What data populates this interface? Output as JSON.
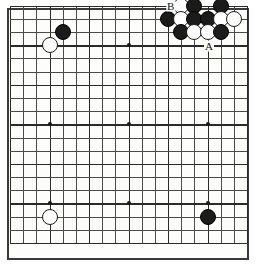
{
  "board": {
    "type": "go-board",
    "size": 19,
    "title": "Go board diagram",
    "origin_px": {
      "x": 10.0,
      "y": 5.8
    },
    "spacing_px": 13.17,
    "star_points": [
      {
        "col": 4,
        "row": 4
      },
      {
        "col": 10,
        "row": 4
      },
      {
        "col": 16,
        "row": 4
      },
      {
        "col": 4,
        "row": 10
      },
      {
        "col": 10,
        "row": 10
      },
      {
        "col": 16,
        "row": 10
      },
      {
        "col": 4,
        "row": 16
      },
      {
        "col": 10,
        "row": 16
      },
      {
        "col": 16,
        "row": 16
      }
    ],
    "colors": {
      "black_stone": "#1b1b1b",
      "white_stone": "#ffffff",
      "stone_outline": "#1b1b1b",
      "grid_line": "#4a4a4a",
      "grid_line_bold": "#2a2a2a",
      "board_background": "#fdfdfb",
      "board_border": "#3a3a3a",
      "label_text": "#111111"
    },
    "stones": [
      {
        "id": "w-d16",
        "color": "white",
        "col": 4,
        "row": 4
      },
      {
        "id": "b-e17",
        "color": "black",
        "col": 5,
        "row": 3
      },
      {
        "id": "w-q19",
        "color": "white",
        "col": 14,
        "row": 1
      },
      {
        "id": "b-r19",
        "color": "black",
        "col": 15,
        "row": 1
      },
      {
        "id": "b-t19",
        "color": "black",
        "col": 17,
        "row": 1
      },
      {
        "id": "b-p18",
        "color": "black",
        "col": 13,
        "row": 2
      },
      {
        "id": "w-q18",
        "color": "white",
        "col": 14,
        "row": 2
      },
      {
        "id": "b-r18",
        "color": "black",
        "col": 15,
        "row": 2
      },
      {
        "id": "b-s18",
        "color": "black",
        "col": 16,
        "row": 2
      },
      {
        "id": "w-t18",
        "color": "white",
        "col": 17,
        "row": 2
      },
      {
        "id": "w-u18",
        "color": "white",
        "col": 18,
        "row": 2
      },
      {
        "id": "b-q17",
        "color": "black",
        "col": 14,
        "row": 3
      },
      {
        "id": "w-r17",
        "color": "white",
        "col": 15,
        "row": 3
      },
      {
        "id": "w-s17",
        "color": "white",
        "col": 16,
        "row": 3
      },
      {
        "id": "b-t17",
        "color": "black",
        "col": 17,
        "row": 3
      },
      {
        "id": "w-d4",
        "color": "white",
        "col": 4,
        "row": 17
      },
      {
        "id": "b-q4",
        "color": "black",
        "col": 16,
        "row": 17
      }
    ],
    "markers": [
      {
        "id": "marker-b",
        "label": "B",
        "col": 13.2,
        "row": 1.0
      },
      {
        "id": "marker-a",
        "label": "A",
        "col": 16.1,
        "row": 4.05
      }
    ]
  }
}
